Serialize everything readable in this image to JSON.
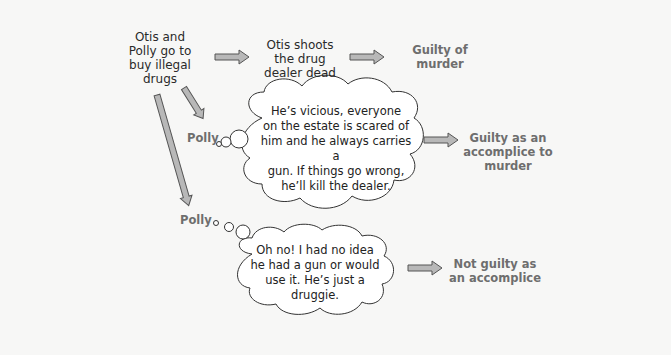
{
  "diagram": {
    "start": {
      "label": "Otis and Polly go to buy illegal drugs",
      "lines": [
        "Otis and",
        "Polly go to",
        "buy illegal",
        "drugs"
      ]
    },
    "step1": {
      "lines": [
        "Otis shoots",
        "the drug",
        "dealer dead"
      ],
      "emphasis": "Otis"
    },
    "outcome1": {
      "lines": [
        "Guilty of",
        "murder"
      ]
    },
    "branch_knowing": {
      "actor": "Polly",
      "thought_lines": [
        "He’s vicious, everyone",
        "on the estate is scared of",
        "him and he always carries a",
        "gun. If things go wrong,",
        "he’ll kill the dealer."
      ],
      "outcome_lines": [
        "Guilty as an",
        "accomplice to",
        "murder"
      ]
    },
    "branch_unknowing": {
      "actor": "Polly",
      "thought_lines": [
        "Oh no! I had no idea",
        "he had a gun or would",
        "use it. He’s just a",
        "druggie."
      ],
      "outcome_lines": [
        "Not guilty as",
        "an accomplice"
      ]
    },
    "colors": {
      "background": "#f7f7f6",
      "arrow_fill": "#b8b8b8",
      "arrow_stroke": "#555555",
      "outcome_text": "#6e6e6e",
      "body_text": "#222222"
    }
  }
}
